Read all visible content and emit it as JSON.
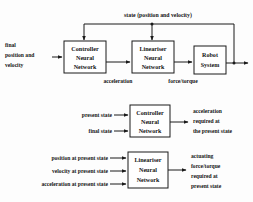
{
  "figure": {
    "type": "block-diagram",
    "background_color": "#fdfdfd",
    "line_color": "#1a1a1a",
    "text_color": "#141414"
  },
  "diagram_top": {
    "feedback_label": "state (position and velocity)",
    "input_label_line1": "final",
    "input_label_line2": "position and",
    "input_label_line3": "velocity",
    "blocks": [
      {
        "line1": "Controller",
        "line2": "Neural",
        "line3": "Network"
      },
      {
        "line1": "Lineariser",
        "line2": "Neural",
        "line3": "Network"
      },
      {
        "line1": "Robot",
        "line2": "System",
        "line3": ""
      }
    ],
    "signal_1": "acceleration",
    "signal_2": "force/torque"
  },
  "diagram_middle": {
    "input_1": "present state",
    "input_2": "final state",
    "block": {
      "line1": "Controller",
      "line2": "Neural",
      "line3": "Network"
    },
    "output_line1": "acceleration",
    "output_line2": "required at",
    "output_line3": "the present state"
  },
  "diagram_bottom": {
    "input_1": "position at present state",
    "input_2": "velocity at present state",
    "input_3": "acceleration at present state",
    "block": {
      "line1": "Lineariser",
      "line2": "Neural",
      "line3": "Network"
    },
    "output_line1": "actuating",
    "output_line2": "force/torque",
    "output_line3": "required at",
    "output_line4": "present state"
  }
}
